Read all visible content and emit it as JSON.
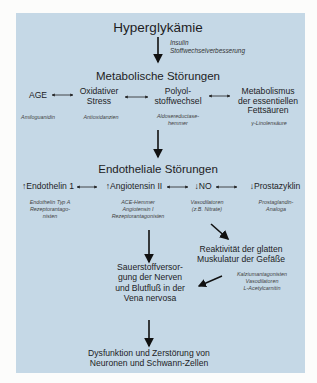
{
  "title": "Hyperglykämie",
  "title_intervention": [
    "Insulin",
    "Stoffwechselverbesserung"
  ],
  "level1": {
    "title": "Metabolische Störungen",
    "items": [
      {
        "label": [
          "AGE"
        ],
        "intervention": [
          "Amiloguanidin"
        ]
      },
      {
        "label": [
          "Oxidativer",
          "Stress"
        ],
        "intervention": [
          "Antioxidanzien"
        ]
      },
      {
        "label": [
          "Polyol-",
          "stoffwechsel"
        ],
        "intervention": [
          "Aldosereductase-",
          "hemmer"
        ]
      },
      {
        "label": [
          "Metabolismus",
          "der essentiellen",
          "Fettsäuren"
        ],
        "intervention": [
          "γ-Linolensäure"
        ]
      }
    ]
  },
  "level2": {
    "title": "Endotheliale Störungen",
    "items": [
      {
        "label": "↑Endothelin 1",
        "intervention": [
          "Endothelin Typ A",
          "Rezeptorantago-",
          "nisten"
        ]
      },
      {
        "label": "↑Angiotensin II",
        "intervention": [
          "ACE-Hemmer",
          "Angiotensin I",
          "Rezeptorantagonisten"
        ]
      },
      {
        "label": "↓NO",
        "intervention": [
          "Vasodilatoren",
          "(z.B. Nitrate)"
        ]
      },
      {
        "label": "↓Prostazyklin",
        "intervention": [
          "Prostaglandin-",
          "Analoga"
        ]
      }
    ]
  },
  "reactivity": {
    "label": [
      "Reaktivität der glatten",
      "Muskulatur der Gefäße"
    ],
    "intervention": [
      "Kalziumantagonisten",
      "Vasodilatoren",
      "L-Acetylcarnitin"
    ]
  },
  "oxygen": {
    "label": [
      "Sauerstoffversor-",
      "gung der Nerven",
      "und Blutfluß in der",
      "Vena nervosa"
    ]
  },
  "outcome": {
    "label": [
      "Dysfunktion und Zerstörung von",
      "Neuronen und Schwann-Zellen"
    ]
  },
  "colors": {
    "panel": "#c5d8e6",
    "text": "#1d1d1f"
  }
}
